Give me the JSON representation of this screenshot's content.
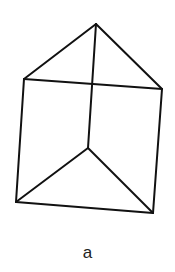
{
  "diagram": {
    "type": "triangular-prism-wireframe",
    "stroke_color": "#111111",
    "stroke_width": 2,
    "vertices": {
      "top_apex": [
        96,
        24
      ],
      "top_left": [
        24,
        79
      ],
      "top_right": [
        162,
        89
      ],
      "bottom_inner": [
        88,
        148
      ],
      "bottom_left": [
        16,
        202
      ],
      "bottom_right": [
        153,
        213
      ]
    },
    "edges": [
      [
        "top_apex",
        "top_left"
      ],
      [
        "top_apex",
        "top_right"
      ],
      [
        "top_left",
        "top_right"
      ],
      [
        "top_apex",
        "bottom_inner"
      ],
      [
        "top_left",
        "bottom_left"
      ],
      [
        "top_right",
        "bottom_right"
      ],
      [
        "bottom_inner",
        "bottom_left"
      ],
      [
        "bottom_inner",
        "bottom_right"
      ],
      [
        "bottom_left",
        "bottom_right"
      ]
    ]
  },
  "caption": "a"
}
